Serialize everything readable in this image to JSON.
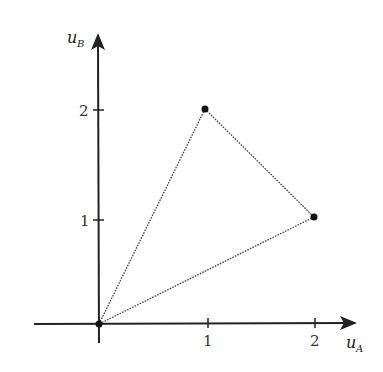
{
  "diagram": {
    "type": "utility-possibility-triangle",
    "x_axis": {
      "label": "u",
      "subscript": "A",
      "ticks": [
        "1",
        "2"
      ]
    },
    "y_axis": {
      "label": "u",
      "subscript": "B",
      "ticks": [
        "1",
        "2"
      ]
    },
    "points": [
      {
        "name": "origin",
        "x": 0,
        "y": 0
      },
      {
        "name": "point-1-2",
        "x": 1,
        "y": 2
      },
      {
        "name": "point-2-1",
        "x": 2,
        "y": 1
      }
    ],
    "edges": [
      [
        "origin",
        "point-1-2"
      ],
      [
        "point-1-2",
        "point-2-1"
      ],
      [
        "point-2-1",
        "origin"
      ]
    ],
    "edge_style": "dotted",
    "colors": {
      "axis": "#222222",
      "edge": "#444444",
      "point": "#111111"
    }
  }
}
